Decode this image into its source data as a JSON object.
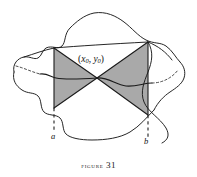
{
  "figure": {
    "caption_word": "Figure",
    "caption_number": "31",
    "caption_full": "FIGURE 31",
    "point_label_open": "(",
    "point_label_x": "x",
    "point_label_x_sub": "0",
    "point_label_comma": ", ",
    "point_label_y": "y",
    "point_label_y_sub": "0",
    "point_label_close": ")",
    "label_a": "a",
    "label_b": "b",
    "colors": {
      "shade": "#a9a9a9",
      "shade_dark": "#9c9c9c",
      "ink": "#1a1a1a",
      "background": "#ffffff",
      "dashed": "#3a3a3a"
    }
  }
}
